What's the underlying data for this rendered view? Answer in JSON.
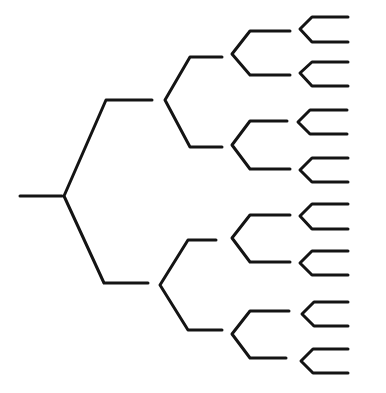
{
  "diagram": {
    "type": "binary-tree",
    "orientation": "left-to-right",
    "levels": 5,
    "stroke_color": "#141414",
    "background": "#ffffff",
    "stroke_width": 3,
    "root": {
      "stem": [
        [
          20,
          196
        ],
        [
          62,
          196
        ]
      ],
      "vertex": [
        64,
        196
      ]
    },
    "branches": [
      {
        "level": 1,
        "vertex": [
          64,
          196
        ],
        "up_end": [
          106,
          100
        ],
        "up_h_end": [
          152,
          100
        ],
        "down_end": [
          104,
          283
        ],
        "down_h_end": [
          148,
          283
        ]
      },
      {
        "level": 2,
        "vertex": [
          165,
          100
        ],
        "up_end": [
          190,
          57
        ],
        "up_h_end": [
          222,
          57
        ],
        "down_end": [
          190,
          147
        ],
        "down_h_end": [
          222,
          147
        ]
      },
      {
        "level": 2,
        "vertex": [
          160,
          285
        ],
        "up_end": [
          188,
          240
        ],
        "up_h_end": [
          216,
          240
        ],
        "down_end": [
          188,
          330
        ],
        "down_h_end": [
          222,
          330
        ]
      },
      {
        "level": 3,
        "vertex": [
          232,
          54
        ],
        "up_end": [
          250,
          31
        ],
        "up_h_end": [
          290,
          31
        ],
        "down_end": [
          250,
          75
        ],
        "down_h_end": [
          290,
          75
        ]
      },
      {
        "level": 3,
        "vertex": [
          232,
          145
        ],
        "up_end": [
          250,
          121
        ],
        "up_h_end": [
          287,
          121
        ],
        "down_end": [
          250,
          169
        ],
        "down_h_end": [
          290,
          169
        ]
      },
      {
        "level": 3,
        "vertex": [
          232,
          238
        ],
        "up_end": [
          250,
          215
        ],
        "up_h_end": [
          290,
          215
        ],
        "down_end": [
          250,
          262
        ],
        "down_h_end": [
          290,
          262
        ]
      },
      {
        "level": 3,
        "vertex": [
          232,
          334
        ],
        "up_end": [
          250,
          311
        ],
        "up_h_end": [
          289,
          311
        ],
        "down_end": [
          250,
          358
        ],
        "down_h_end": [
          286,
          358
        ]
      },
      {
        "level": 4,
        "vertex": [
          300,
          29
        ],
        "up_end": [
          312,
          17
        ],
        "up_h_end": [
          348,
          17
        ],
        "down_end": [
          312,
          42
        ],
        "down_h_end": [
          348,
          42
        ]
      },
      {
        "level": 4,
        "vertex": [
          300,
          73
        ],
        "up_end": [
          312,
          62
        ],
        "up_h_end": [
          348,
          62
        ],
        "down_end": [
          312,
          86
        ],
        "down_h_end": [
          348,
          86
        ]
      },
      {
        "level": 4,
        "vertex": [
          298,
          122
        ],
        "up_end": [
          310,
          110
        ],
        "up_h_end": [
          347,
          110
        ],
        "down_end": [
          310,
          134
        ],
        "down_h_end": [
          347,
          134
        ]
      },
      {
        "level": 4,
        "vertex": [
          300,
          170
        ],
        "up_end": [
          312,
          158
        ],
        "up_h_end": [
          348,
          158
        ],
        "down_end": [
          312,
          182
        ],
        "down_h_end": [
          348,
          182
        ]
      },
      {
        "level": 4,
        "vertex": [
          300,
          216
        ],
        "up_end": [
          312,
          204
        ],
        "up_h_end": [
          348,
          204
        ],
        "down_end": [
          312,
          229
        ],
        "down_h_end": [
          348,
          229
        ]
      },
      {
        "level": 4,
        "vertex": [
          300,
          263
        ],
        "up_end": [
          312,
          251
        ],
        "up_h_end": [
          348,
          251
        ],
        "down_end": [
          312,
          275
        ],
        "down_h_end": [
          348,
          275
        ]
      },
      {
        "level": 4,
        "vertex": [
          302,
          314
        ],
        "up_end": [
          314,
          302
        ],
        "up_h_end": [
          348,
          302
        ],
        "down_end": [
          314,
          326
        ],
        "down_h_end": [
          348,
          326
        ]
      },
      {
        "level": 4,
        "vertex": [
          301,
          361
        ],
        "up_end": [
          313,
          349
        ],
        "up_h_end": [
          348,
          349
        ],
        "down_end": [
          313,
          373
        ],
        "down_h_end": [
          348,
          373
        ]
      }
    ],
    "leaf_count": 16
  }
}
